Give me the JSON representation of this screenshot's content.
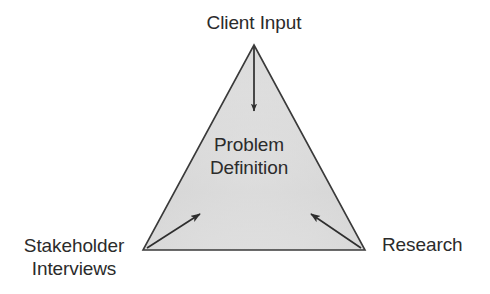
{
  "diagram": {
    "type": "triangle-relationship-diagram",
    "center": {
      "line_1": "Problem",
      "line_2": "Definition"
    },
    "vertices": [
      {
        "id": "client-input",
        "label": "Client Input",
        "position": "top",
        "arrow": "down"
      },
      {
        "id": "stakeholder-interviews",
        "label_line_1": "Stakeholder",
        "label_line_2": "Interviews",
        "position": "bottom-left",
        "arrow": "up-right"
      },
      {
        "id": "research",
        "label": "Research",
        "position": "bottom-right",
        "arrow": "up-left"
      }
    ],
    "colors": {
      "outline": "#3a3a3a",
      "fill_light": "#efefef",
      "fill_mid": "#d9d9d9",
      "fill_dark": "#cfcfcf",
      "text": "#2b2b2b",
      "arrow": "#2e2e2e",
      "background": "#ffffff"
    }
  }
}
